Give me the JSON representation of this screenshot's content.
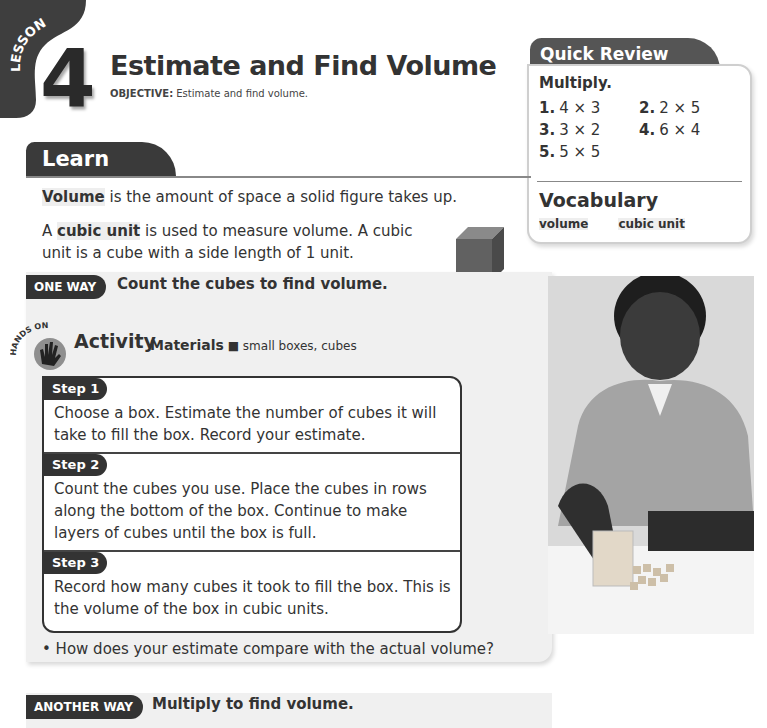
{
  "lesson": {
    "tab_label": "LESSON",
    "number": "4",
    "title": "Estimate and Find Volume",
    "objective_label": "OBJECTIVE:",
    "objective_text": " Estimate and find volume."
  },
  "quick_review": {
    "tab_label": "Quick Review",
    "heading": "Multiply.",
    "problems": [
      {
        "num": "1.",
        "expr": "4 × 3"
      },
      {
        "num": "2.",
        "expr": "2 × 5"
      },
      {
        "num": "3.",
        "expr": "3 × 2"
      },
      {
        "num": "4.",
        "expr": "6 × 4"
      },
      {
        "num": "5.",
        "expr": "5 × 5"
      }
    ],
    "vocab_heading": "Vocabulary",
    "vocab_words": [
      "volume",
      "cubic unit"
    ]
  },
  "learn": {
    "tab_label": "Learn",
    "p1_term": "Volume",
    "p1_rest": " is the amount of space a solid figure takes up.",
    "p2_lead": "A ",
    "p2_term": "cubic unit",
    "p2_rest": " is used to measure volume. A cubic unit is a cube with a side length of 1 unit.",
    "cube_label": "1 cubic unit"
  },
  "one_way": {
    "badge": "ONE WAY",
    "title": "Count the cubes to find volume.",
    "hands_on_label": "HANDS ON",
    "activity_title": "Activity",
    "materials_label": "Materials",
    "materials_text": " small boxes, cubes",
    "steps": [
      {
        "label": "Step 1",
        "text": "Choose a box. Estimate the number of cubes it will take to fill the box. Record your estimate."
      },
      {
        "label": "Step 2",
        "text": "Count the cubes you use. Place the cubes in rows along the bottom of the box. Continue to make layers of cubes until the box is full."
      },
      {
        "label": "Step 3",
        "text": "Record how many cubes it took to fill the box. This is the volume of the box in cubic units."
      }
    ],
    "question": "• How does your estimate compare with the actual volume?"
  },
  "another_way": {
    "badge": "ANOTHER WAY",
    "title": "Multiply to find volume."
  },
  "photo": {
    "description": "student filling a box with unit cubes"
  }
}
